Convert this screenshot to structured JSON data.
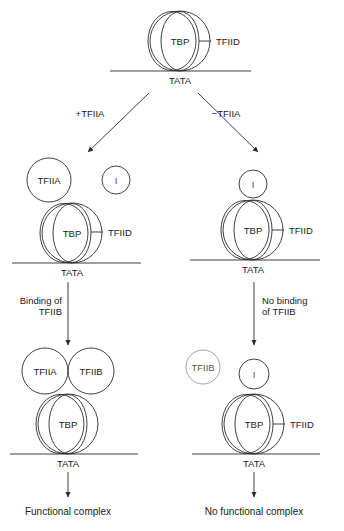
{
  "figure": {
    "type": "biology-pathway-diagram",
    "stroke_color": "#2b2b2b",
    "faint_stroke_color": "#9a9a9a",
    "background": "#ffffff"
  },
  "top_complex": {
    "tbp_label": "TBP",
    "tfiid_label": "TFIID",
    "dna_label": "TATA"
  },
  "branches": {
    "left_label": "+TFIIA",
    "right_label": "−TFIIA"
  },
  "middle_left_complex": {
    "tfiia_label": "TFIIA",
    "free_factor_label": "I",
    "tbp_label": "TBP",
    "tfiid_label": "TFIID",
    "dna_label": "TATA"
  },
  "middle_right_complex": {
    "bound_factor_label": "I",
    "tbp_label": "TBP",
    "tfiid_label": "TFIID",
    "dna_label": "TATA"
  },
  "transitions": {
    "left_line1": "Binding of",
    "left_line2": "TFIIB",
    "right_line1": "No binding",
    "right_line2": "of TFIIB"
  },
  "bottom_left_complex": {
    "tfiia_label": "TFIIA",
    "tfiib_label": "TFIIB",
    "tbp_label": "TBP",
    "dna_label": "TATA"
  },
  "bottom_right_complex": {
    "free_tfiib_label": "TFIIB",
    "bound_factor_label": "I",
    "tbp_label": "TBP",
    "tfiid_label": "TFIID",
    "dna_label": "TATA"
  },
  "outcomes": {
    "left": "Functional complex",
    "right": "No functional complex"
  }
}
